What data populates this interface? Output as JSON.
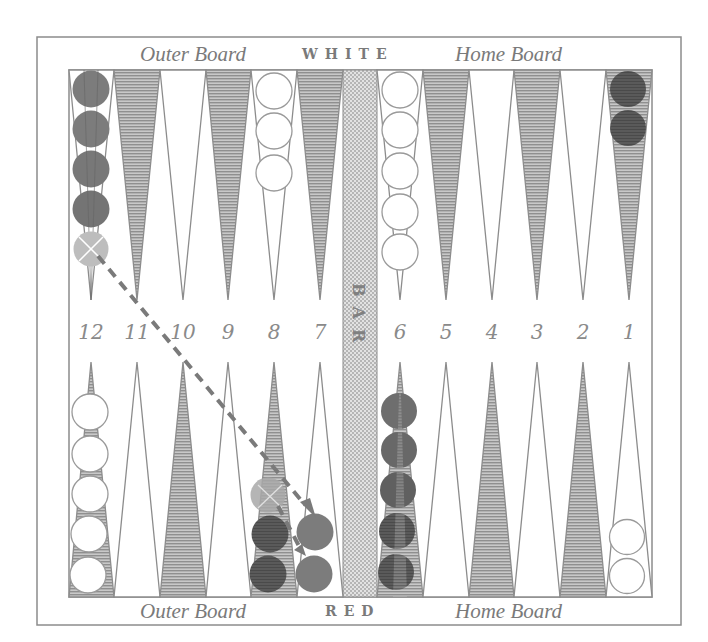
{
  "board": {
    "top_side_label": "WHITE",
    "bottom_side_label": "RED",
    "bar_label": "BAR",
    "top_left_label": "Outer Board",
    "top_right_label": "Home Board",
    "bottom_left_label": "Outer Board",
    "bottom_right_label": "Home Board",
    "point_numbers": [
      "12",
      "11",
      "10",
      "9",
      "8",
      "7",
      "6",
      "5",
      "4",
      "3",
      "2",
      "1"
    ]
  },
  "colors": {
    "frame": "#8c8c8c",
    "stripe_point": "#a8a8a8",
    "bar_fill": "#d4d4d4",
    "red_checker": "#808080",
    "red_checker_dark": "#5e5e5e",
    "white_checker": "#ffffff",
    "ghost_checker": "#bdbdbd",
    "move_line": "#7a7a7a"
  },
  "checkers": {
    "top": [
      {
        "point": "12",
        "color": "red",
        "count": 4,
        "ghost_after": 1
      },
      {
        "point": "8",
        "color": "white",
        "count": 3
      },
      {
        "point": "6",
        "color": "white",
        "count": 5
      },
      {
        "point": "1",
        "color": "red_dark",
        "count": 2
      }
    ],
    "bottom": [
      {
        "point": "12",
        "color": "white",
        "count": 5
      },
      {
        "point": "8",
        "color": "red_dark",
        "count": 2,
        "ghost_above": 1
      },
      {
        "point": "7",
        "color": "red",
        "count": 2
      },
      {
        "point": "6",
        "color": "red_dark",
        "count": 5
      },
      {
        "point": "1",
        "color": "white",
        "count": 2
      }
    ]
  },
  "moves": [
    {
      "from": "12 (top)",
      "to": "7 (bottom)",
      "style": "dashed-arrow"
    },
    {
      "from": "8 (bottom)",
      "to": "7 (bottom)",
      "style": "dashed-arrow"
    }
  ]
}
